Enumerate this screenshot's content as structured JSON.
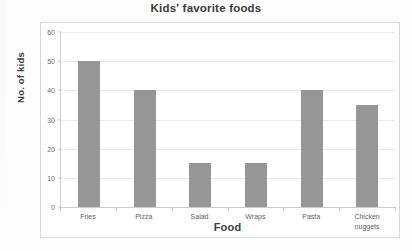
{
  "chart_data": {
    "type": "bar",
    "title": "Kids' favorite foods",
    "xlabel": "Food",
    "ylabel": "No. of kids",
    "categories": [
      "Fries",
      "Pizza",
      "Salad",
      "Wraps",
      "Pasta",
      "Chicken nuggets"
    ],
    "category_lines": [
      [
        "Fries"
      ],
      [
        "Pizza"
      ],
      [
        "Salad"
      ],
      [
        "Wraps"
      ],
      [
        "Pasta"
      ],
      [
        "Chicken",
        "nuggets"
      ]
    ],
    "values": [
      50,
      40,
      15,
      15,
      40,
      35
    ],
    "ylim": [
      0,
      60
    ],
    "yticks": [
      0,
      10,
      20,
      30,
      40,
      50,
      60
    ],
    "ytick_labels": [
      "0",
      "10",
      "20",
      "30",
      "40",
      "50",
      "60"
    ],
    "grid": true,
    "legend": false,
    "bar_color": "#969696",
    "gridline_color": "#e9e9e9",
    "axis_color": "#cdcdcd",
    "title_color": "#3a3a3a",
    "tick_label_color": "#6b6b6b"
  }
}
